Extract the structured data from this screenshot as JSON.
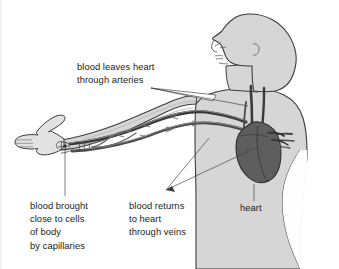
{
  "figure": {
    "kind": "anatomical-diagram",
    "background_color": "#ffffff"
  },
  "palette": {
    "body_fill": "#d6d6d6",
    "body_outline": "#3c3c3c",
    "heart_fill": "#5e5e5e",
    "heart_outline": "#2b2b2b",
    "vessel_dark": "#3a3a3a",
    "vessel_mid": "#6f6f6f",
    "vessel_light": "#9a9a9a",
    "text_color": "#1b1b1b",
    "leader_color": "#3a3a3a"
  },
  "labels": {
    "arteries": {
      "id": "arteries-label",
      "lines": [
        "blood leaves heart",
        "through arteries"
      ],
      "line1": "blood leaves heart",
      "line2": "through arteries"
    },
    "capillaries": {
      "id": "capillaries-label",
      "lines": [
        "blood brought",
        "close to cells",
        "of body",
        "by capillaries"
      ],
      "line1": "blood brought",
      "line2": "close to cells",
      "line3": "of body",
      "line4": "by capillaries"
    },
    "veins": {
      "id": "veins-label",
      "lines": [
        "blood returns",
        "to heart",
        "through veins"
      ],
      "line1": "blood returns",
      "line2": "to heart",
      "line3": "through veins"
    },
    "heart": {
      "id": "heart-label",
      "lines": [
        "heart"
      ],
      "line1": "heart"
    }
  },
  "anatomy": {
    "head": "head-profile-facing-left",
    "torso": "torso-silhouette",
    "arm": "outstretched-left-arm",
    "hand": "open-hand-with-thumb",
    "heart": "heart-organ",
    "artery_vessel": "artery-tube",
    "vein_vessel": "vein-tube",
    "capillary_bed": "capillary-network-at-wrist"
  }
}
